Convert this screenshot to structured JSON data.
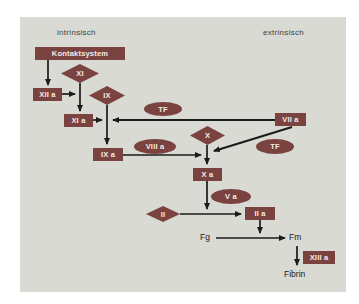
{
  "colors": {
    "shape": "#7b4340",
    "panel_bg": "#d8dad3",
    "arrow": "#1b1b19",
    "label": "#3e3e3a"
  },
  "diagram": {
    "section_labels": {
      "left": "intrinsisch",
      "right": "extrinsisch"
    },
    "nodes": {
      "kontaktsystem": "Kontaktsystem",
      "xi": "XI",
      "xii_a": "XII a",
      "ix": "IX",
      "xi_a": "XI a",
      "tf": "TF",
      "vii_a": "VII a",
      "x": "X",
      "viii_a": "VIII a",
      "ix_a": "IX a",
      "x_a": "X a",
      "v_a": "V a",
      "ii": "II",
      "ii_a": "II a",
      "fg": "Fg",
      "fm": "Fm",
      "xiii_a": "XIII a",
      "fibrin": "Fibrin"
    },
    "edges": [
      {
        "from": "Kontaktsystem",
        "to": "XII a"
      },
      {
        "from": "XI",
        "to": "XI a",
        "activated_by": "XII a"
      },
      {
        "from": "IX",
        "to": "IX a",
        "activated_by": "XI a, VII a + TF"
      },
      {
        "from": "X",
        "to": "X a",
        "activated_by": "IX a + VIII a, VII a + TF"
      },
      {
        "from": "II",
        "to": "II a",
        "activated_by": "X a + V a"
      },
      {
        "from": "Fg",
        "to": "Fm",
        "activated_by": "II a"
      },
      {
        "from": "Fm",
        "to": "Fibrin",
        "activated_by": "XIII a"
      }
    ]
  }
}
